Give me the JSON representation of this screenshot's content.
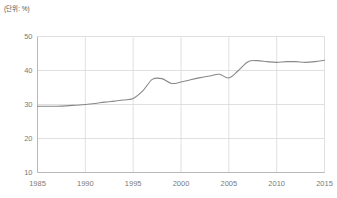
{
  "chart_data": {
    "type": "line",
    "title": "",
    "unit_label": "(단위: %)",
    "xlabel": "",
    "ylabel": "",
    "xlim": [
      1985,
      2015
    ],
    "ylim": [
      10,
      50
    ],
    "grid": true,
    "legend": false,
    "line_color": "#888888",
    "grid_color": "#d8d8d8",
    "axis_color": "#b0b0b0",
    "tick_label_color": "#7a7a7a",
    "xticks": [
      1985,
      1990,
      1995,
      2000,
      2005,
      2010,
      2015
    ],
    "yticks": [
      10,
      20,
      30,
      40,
      50
    ],
    "x": [
      1985,
      1986,
      1987,
      1988,
      1989,
      1990,
      1991,
      1992,
      1993,
      1994,
      1995,
      1996,
      1997,
      1998,
      1999,
      2000,
      2001,
      2002,
      2003,
      2004,
      2005,
      2006,
      2007,
      2008,
      2009,
      2010,
      2011,
      2012,
      2013,
      2014,
      2015
    ],
    "values": [
      29.5,
      29.5,
      29.5,
      29.6,
      29.8,
      30.0,
      30.3,
      30.7,
      31.0,
      31.3,
      31.8,
      34.0,
      37.4,
      37.6,
      36.2,
      36.6,
      37.3,
      37.9,
      38.4,
      38.9,
      37.8,
      40.0,
      42.6,
      42.9,
      42.6,
      42.4,
      42.6,
      42.6,
      42.4,
      42.6,
      43.0
    ],
    "series": [
      {
        "name": "series-1",
        "values": [
          29.5,
          29.5,
          29.5,
          29.6,
          29.8,
          30.0,
          30.3,
          30.7,
          31.0,
          31.3,
          31.8,
          34.0,
          37.4,
          37.6,
          36.2,
          36.6,
          37.3,
          37.9,
          38.4,
          38.9,
          37.8,
          40.0,
          42.6,
          42.9,
          42.6,
          42.4,
          42.6,
          42.6,
          42.4,
          42.6,
          43.0
        ]
      }
    ]
  }
}
